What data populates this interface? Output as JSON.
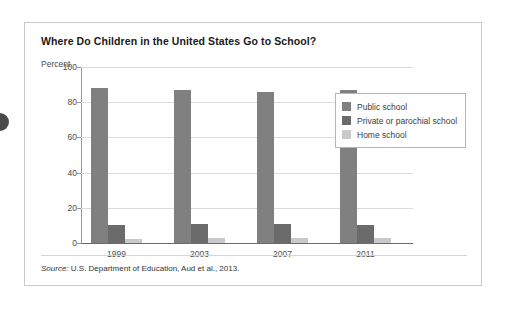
{
  "figure": {
    "title": "Where Do Children in the United States Go to School?",
    "source_prefix": "Source:",
    "source_text": " U.S. Department of Education, Aud et al., 2013."
  },
  "colors": {
    "public_school": "#808080",
    "private_school": "#6b6b6b",
    "home_school": "#c9c9c9",
    "axis": "#6b6b6b",
    "grid": "#dcdcdc",
    "card_border": "#c9c9c9",
    "text": "#3d3d3d"
  },
  "chart_data": {
    "type": "bar",
    "title": "Where Do Children in the United States Go to School?",
    "xlabel": "",
    "ylabel": "Percent",
    "ylim": [
      0,
      100
    ],
    "yticks": [
      0,
      20,
      40,
      60,
      80,
      100
    ],
    "ytick_labels": [
      "0",
      "20",
      "40",
      "60",
      "80",
      "100"
    ],
    "grid": true,
    "legend_position": "upper right (inset)",
    "categories": [
      "1999",
      "2003",
      "2007",
      "2011"
    ],
    "series": [
      {
        "name": "Public school",
        "color": "#808080",
        "values": [
          88,
          87,
          86,
          87
        ]
      },
      {
        "name": "Private or parochial school",
        "color": "#6b6b6b",
        "values": [
          10,
          11,
          11,
          10
        ]
      },
      {
        "name": "Home school",
        "color": "#c9c9c9",
        "values": [
          2,
          3,
          3,
          3
        ]
      }
    ]
  }
}
